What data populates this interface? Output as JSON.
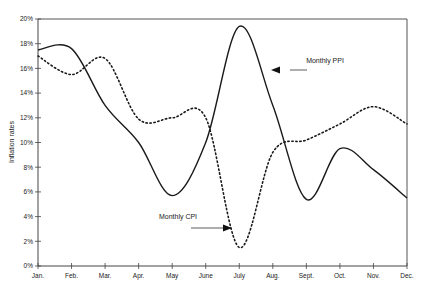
{
  "chart_data": {
    "type": "line",
    "title": "",
    "xlabel": "",
    "ylabel": "Inflation rates",
    "ylim": [
      0,
      20
    ],
    "y_ticks": [
      "0%",
      "2%",
      "4%",
      "6%",
      "8%",
      "10%",
      "12%",
      "14%",
      "16%",
      "18%",
      "20%"
    ],
    "y_tick_values": [
      0,
      2,
      4,
      6,
      8,
      10,
      12,
      14,
      16,
      18,
      20
    ],
    "categories": [
      "Jan.",
      "Feb.",
      "Mar.",
      "Apr.",
      "May",
      "June",
      "July",
      "Aug.",
      "Sept.",
      "Oct.",
      "Nov.",
      "Dec."
    ],
    "grid": false,
    "legend": "none (inline annotations)",
    "series": [
      {
        "name": "Monthly PPI",
        "style": "solid",
        "color": "#1a1a1a",
        "values": [
          17.5,
          17.6,
          13.0,
          10.0,
          5.7,
          10.0,
          19.4,
          13.0,
          5.4,
          9.5,
          7.8,
          5.5
        ]
      },
      {
        "name": "Monthly CPI",
        "style": "dotted",
        "color": "#1a1a1a",
        "values": [
          17.0,
          15.5,
          16.8,
          11.9,
          12.0,
          12.0,
          1.5,
          9.2,
          10.2,
          11.5,
          12.9,
          11.5
        ]
      }
    ],
    "annotations": [
      {
        "text": "Monthly PPI",
        "target_series": "Monthly PPI",
        "arrow_direction": "left"
      },
      {
        "text": "Monthly CPI",
        "target_series": "Monthly CPI",
        "arrow_direction": "right"
      }
    ]
  }
}
